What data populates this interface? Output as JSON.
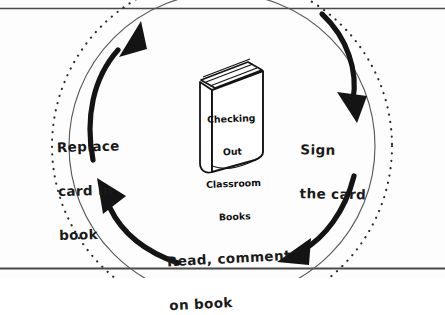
{
  "diagram": {
    "title_on_book": {
      "lines": [
        "Checking",
        "Out",
        "Classroom",
        "Books"
      ],
      "full_text": "Checking Out Classroom Books"
    },
    "cycle_steps": [
      {
        "id": "sign-the-card",
        "lines": [
          "Sign",
          "the card"
        ],
        "full_text": "Sign the card",
        "position": "right"
      },
      {
        "id": "read-comment-on-book",
        "lines": [
          "Read, comment",
          "on book"
        ],
        "full_text": "Read, comment on book",
        "position": "bottom"
      },
      {
        "id": "replace-card-in-book",
        "lines": [
          "Replace",
          "card in",
          "book"
        ],
        "full_text": "Replace card in book",
        "position": "left"
      }
    ],
    "arrows": [
      {
        "id": "arrow-top-left",
        "direction": "up-right",
        "from_step": "replace-card-in-book",
        "to_step": "top"
      },
      {
        "id": "arrow-right",
        "direction": "down",
        "from_step": "top",
        "to_step": "sign-the-card"
      },
      {
        "id": "arrow-bottom-right",
        "direction": "down-left",
        "from_step": "sign-the-card",
        "to_step": "read-comment-on-book"
      },
      {
        "id": "arrow-bottom-left",
        "direction": "up-left",
        "from_step": "read-comment-on-book",
        "to_step": "replace-card-in-book"
      }
    ],
    "colors": {
      "ink": "#1a1a1a",
      "paper": "#fdfdfd",
      "rule_line": "#4a4a4a"
    },
    "rules": {
      "top_rule": true,
      "bottom_rule": true
    }
  }
}
